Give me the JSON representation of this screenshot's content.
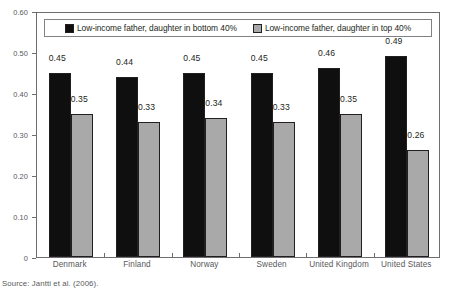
{
  "chart_data": {
    "type": "bar",
    "title": "",
    "subtitle": "",
    "xlabel": "",
    "ylabel": "",
    "ylim": [
      0,
      0.6
    ],
    "yticks": [
      0,
      0.1,
      0.2,
      0.3,
      0.4,
      0.5,
      0.6
    ],
    "ytick_labels": [
      "0",
      "0.10",
      "0.20",
      "0.30",
      "0.40",
      "0.50",
      "0.60"
    ],
    "grid": false,
    "legend_position": "top-inside",
    "categories": [
      "Denmark",
      "Finland",
      "Norway",
      "Sweden",
      "United Kingdom",
      "United States"
    ],
    "series": [
      {
        "name": "Low-income father, daughter in bottom 40%",
        "color": "#100f0f",
        "values": [
          0.45,
          0.44,
          0.45,
          0.45,
          0.46,
          0.49
        ],
        "labels": [
          "0.45",
          "0.44",
          "0.45",
          "0.45",
          "0.46",
          "0.49"
        ]
      },
      {
        "name": "Low-income father, daughter in top 40%",
        "color": "#a9a9a9",
        "values": [
          0.35,
          0.33,
          0.34,
          0.33,
          0.35,
          0.26
        ],
        "labels": [
          "0.35",
          "0.33",
          "0.34",
          "0.33",
          "0.35",
          "0.26"
        ]
      }
    ]
  },
  "legend": {
    "entries": [
      {
        "label": "Low-income father, daughter in bottom 40%",
        "swatch": "dark"
      },
      {
        "label": "Low-income father, daughter in top 40%",
        "swatch": "light"
      }
    ]
  },
  "source": {
    "text": "Source: Jantti et al. (2006)."
  }
}
